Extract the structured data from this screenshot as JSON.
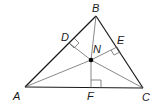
{
  "diagram": {
    "points": {
      "A": {
        "label": "A",
        "x": 25,
        "y": 87
      },
      "B": {
        "label": "B",
        "x": 96,
        "y": 16
      },
      "C": {
        "label": "C",
        "x": 143,
        "y": 88
      },
      "D": {
        "label": "D",
        "x": 69,
        "y": 43
      },
      "E": {
        "label": "E",
        "x": 117,
        "y": 47
      },
      "F": {
        "label": "F",
        "x": 91,
        "y": 88
      },
      "N": {
        "label": "N",
        "x": 91,
        "y": 60
      }
    },
    "colors": {
      "stroke": "#1a1a1a",
      "thin_stroke": "#555555",
      "point": "#000000"
    }
  }
}
